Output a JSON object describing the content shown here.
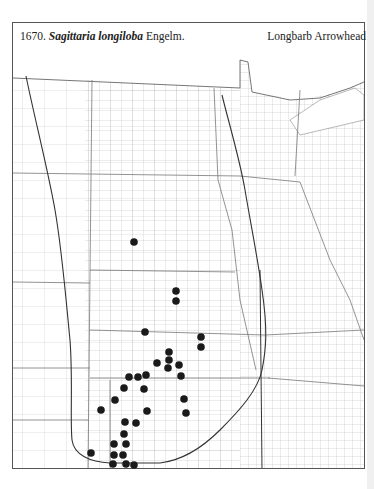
{
  "header": {
    "number": "1670.",
    "genus_species": "Sagittaria longiloba",
    "author": "Engelm.",
    "common_name": "Longbarb Arrowhead"
  },
  "map": {
    "region": "Great Plains, USA (county outline map)",
    "line_color": "#777777",
    "range_line_color": "#333333",
    "dot_color": "#1a1a1a",
    "occurrences": [
      [
        134,
        242
      ],
      [
        176,
        291
      ],
      [
        176,
        301
      ],
      [
        145,
        332
      ],
      [
        201,
        337
      ],
      [
        201,
        347
      ],
      [
        169,
        352
      ],
      [
        169,
        360
      ],
      [
        168,
        368
      ],
      [
        157,
        363
      ],
      [
        179,
        365
      ],
      [
        181,
        376
      ],
      [
        129,
        377
      ],
      [
        138,
        377
      ],
      [
        146,
        375
      ],
      [
        124,
        388
      ],
      [
        144,
        389
      ],
      [
        115,
        400
      ],
      [
        184,
        399
      ],
      [
        101,
        410
      ],
      [
        147,
        411
      ],
      [
        186,
        413
      ],
      [
        125,
        422
      ],
      [
        136,
        423
      ],
      [
        124,
        434
      ],
      [
        126,
        444
      ],
      [
        114,
        444
      ],
      [
        91,
        453
      ],
      [
        114,
        455
      ],
      [
        123,
        455
      ],
      [
        113,
        464
      ],
      [
        126,
        464
      ],
      [
        134,
        465
      ]
    ]
  }
}
